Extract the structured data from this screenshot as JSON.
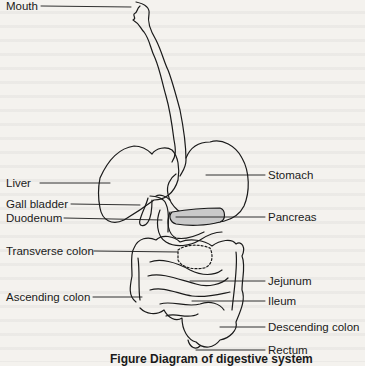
{
  "diagram": {
    "type": "anatomical diagram",
    "labels": {
      "mouth": "Mouth",
      "stomach": "Stomach",
      "liver": "Liver",
      "gall_bladder": "Gall bladder",
      "pancreas": "Pancreas",
      "duodenum": "Duodenum",
      "transverse_colon": "Transverse colon",
      "jejunum": "Jejunum",
      "ascending_colon": "Ascending colon",
      "ileum": "Ileum",
      "descending_colon": "Descending colon",
      "rectum": "Rectum"
    },
    "caption": "Figure   Diagram of digestive system",
    "colors": {
      "background": "#f4f2ee",
      "line": "#1a1a1a",
      "pancreas_fill": "#c9c9c9"
    }
  }
}
